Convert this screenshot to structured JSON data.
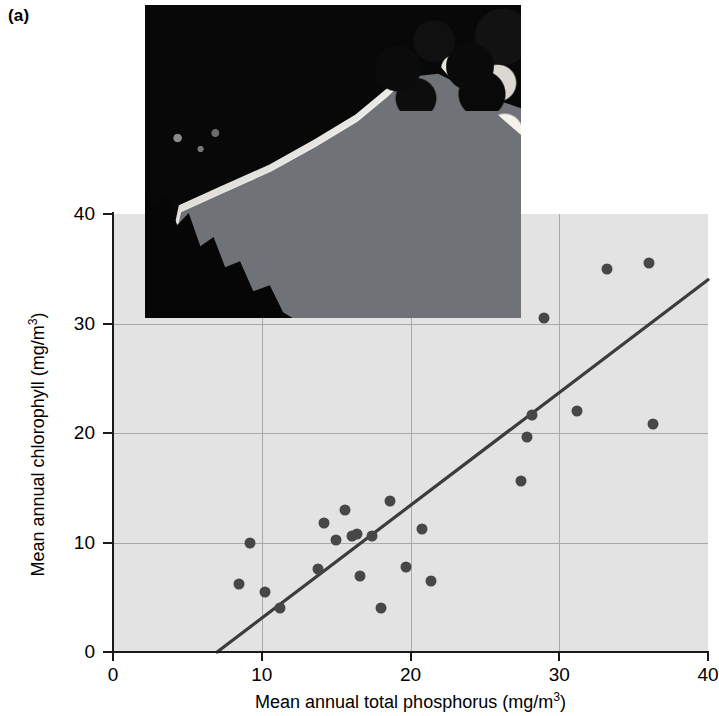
{
  "panel": {
    "label": "(a)"
  },
  "photo": {
    "alt_name": "reservoir-shoreline-aerial-photograph"
  },
  "axes": {
    "x_ticks": [
      "0",
      "10",
      "20",
      "30",
      "40"
    ],
    "y_ticks": [
      "0",
      "10",
      "20",
      "30",
      "40"
    ],
    "xlabel_text": "Mean annual total phosphorus (mg/m",
    "xlabel_sup": "3",
    "xlabel_tail": ")",
    "ylabel_text": "Mean annual chlorophyll (mg/m",
    "ylabel_sup": "3",
    "ylabel_tail": ")"
  },
  "colors": {
    "plot_background": "#e3e3e3",
    "gridline": "#a9a9a9",
    "axis": "#1a1a1a",
    "marker": "#474747",
    "fit_line": "#3c3c3c"
  },
  "chart_data": {
    "type": "scatter",
    "title": "",
    "xlabel": "Mean annual total phosphorus (mg/m3)",
    "ylabel": "Mean annual chlorophyll (mg/m3)",
    "xlim": [
      0,
      40
    ],
    "ylim": [
      0,
      40
    ],
    "xticks": [
      0,
      10,
      20,
      30,
      40
    ],
    "yticks": [
      0,
      10,
      20,
      30,
      40
    ],
    "grid": true,
    "legend": null,
    "points": [
      {
        "x": 8.5,
        "y": 6.2
      },
      {
        "x": 9.2,
        "y": 10.0
      },
      {
        "x": 10.2,
        "y": 5.5
      },
      {
        "x": 11.2,
        "y": 4.0
      },
      {
        "x": 13.8,
        "y": 7.6
      },
      {
        "x": 14.2,
        "y": 11.8
      },
      {
        "x": 15.0,
        "y": 10.2
      },
      {
        "x": 15.6,
        "y": 13.0
      },
      {
        "x": 16.1,
        "y": 10.6
      },
      {
        "x": 16.4,
        "y": 10.8
      },
      {
        "x": 16.6,
        "y": 6.9
      },
      {
        "x": 17.4,
        "y": 10.6
      },
      {
        "x": 18.0,
        "y": 4.0
      },
      {
        "x": 18.6,
        "y": 13.8
      },
      {
        "x": 19.7,
        "y": 7.8
      },
      {
        "x": 20.8,
        "y": 11.2
      },
      {
        "x": 21.4,
        "y": 6.5
      },
      {
        "x": 27.4,
        "y": 15.6
      },
      {
        "x": 27.8,
        "y": 19.6
      },
      {
        "x": 28.2,
        "y": 21.6
      },
      {
        "x": 29.0,
        "y": 30.5
      },
      {
        "x": 31.2,
        "y": 22.0
      },
      {
        "x": 33.2,
        "y": 35.0
      },
      {
        "x": 36.0,
        "y": 35.5
      },
      {
        "x": 36.3,
        "y": 20.8
      }
    ],
    "fit_line": {
      "type": "linear-regression",
      "x_start": 7.0,
      "y_start": 0.0,
      "x_end": 40.0,
      "y_end": 34.0
    }
  }
}
